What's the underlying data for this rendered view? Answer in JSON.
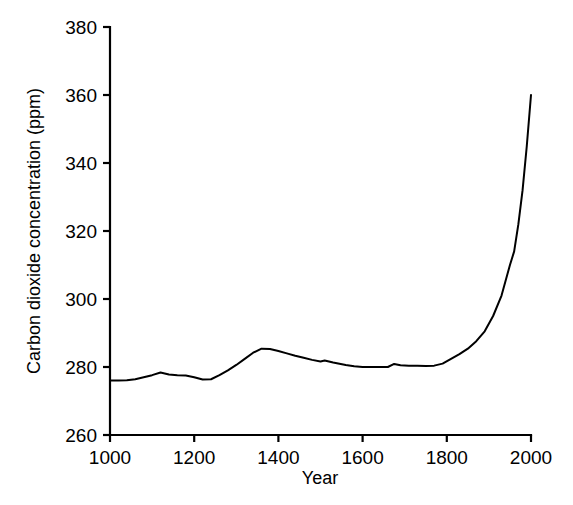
{
  "chart_data": {
    "type": "line",
    "title": "",
    "subtitle": "",
    "xlabel": "Year",
    "ylabel": "Carbon dioxide concentration (ppm)",
    "xlim": [
      1000,
      2000
    ],
    "ylim": [
      260,
      380
    ],
    "xticks": [
      1000,
      1200,
      1400,
      1600,
      1800,
      2000
    ],
    "xtick_labels": [
      "1000",
      "1200",
      "1400",
      "1600",
      "1800",
      "2000"
    ],
    "yticks": [
      260,
      280,
      300,
      320,
      340,
      360,
      380
    ],
    "ytick_labels": [
      "260",
      "280",
      "300",
      "320",
      "340",
      "360",
      "380"
    ],
    "grid": false,
    "legend": false,
    "legend_position": "none",
    "line_color": "#000000",
    "background_color": "#ffffff",
    "series": [
      {
        "name": "Carbon dioxide concentration",
        "x": [
          1000,
          1020,
          1040,
          1060,
          1080,
          1100,
          1120,
          1140,
          1160,
          1180,
          1200,
          1220,
          1240,
          1260,
          1280,
          1300,
          1320,
          1340,
          1360,
          1380,
          1400,
          1420,
          1440,
          1460,
          1480,
          1500,
          1510,
          1530,
          1560,
          1580,
          1600,
          1620,
          1640,
          1660,
          1675,
          1690,
          1710,
          1730,
          1750,
          1770,
          1790,
          1810,
          1830,
          1850,
          1870,
          1890,
          1910,
          1930,
          1950,
          1960,
          1970,
          1980,
          1990,
          2000
        ],
        "values": [
          276.0,
          276.0,
          276.1,
          276.4,
          277.0,
          277.6,
          278.4,
          277.8,
          277.6,
          277.5,
          277.0,
          276.3,
          276.4,
          277.6,
          279.0,
          280.6,
          282.4,
          284.2,
          285.4,
          285.3,
          284.7,
          284.0,
          283.3,
          282.7,
          282.1,
          281.6,
          281.9,
          281.3,
          280.6,
          280.2,
          280.0,
          280.0,
          280.0,
          280.0,
          280.9,
          280.5,
          280.4,
          280.4,
          280.3,
          280.4,
          281.0,
          282.4,
          283.8,
          285.4,
          287.6,
          290.5,
          295.0,
          301.0,
          310.0,
          314.0,
          322.0,
          332.0,
          345.0,
          360.0
        ]
      }
    ]
  },
  "axes": {
    "y_axis_title": "Carbon dioxide concentration (ppm)",
    "x_axis_title": "Year"
  }
}
